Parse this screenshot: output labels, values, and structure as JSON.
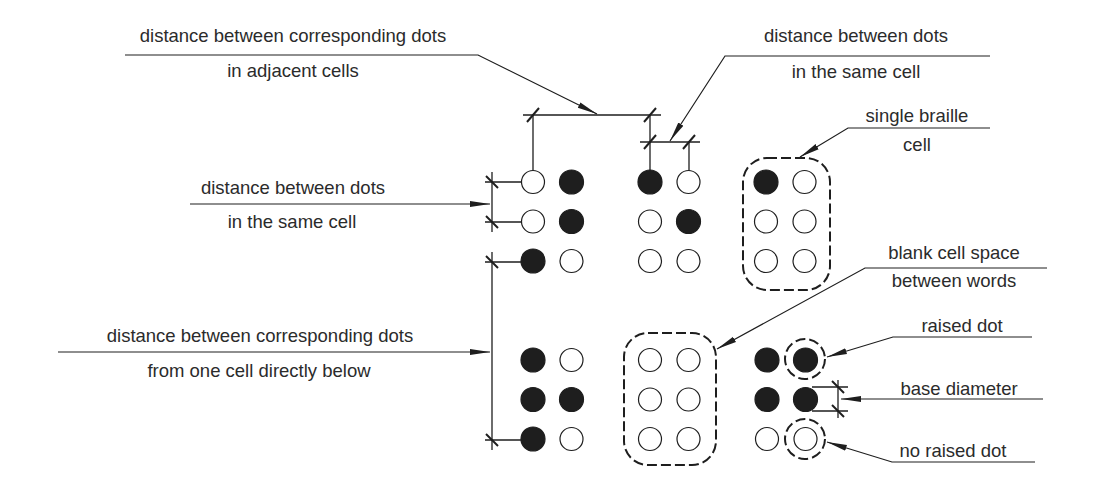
{
  "colors": {
    "ink": "#1e1e1e",
    "text": "#2b2b2b",
    "background": "#ffffff"
  },
  "labels": {
    "adjacent_cells": {
      "line1": "distance between corresponding dots",
      "line2": "in adjacent cells"
    },
    "same_cell_top": {
      "line1": "distance between dots",
      "line2": "in the same cell"
    },
    "same_cell_left": {
      "line1": "distance between dots",
      "line2": "in the same cell"
    },
    "single_cell": {
      "line1": "single braille",
      "line2": "cell"
    },
    "below_cell": {
      "line1": "distance between corresponding dots",
      "line2": "from one cell directly below"
    },
    "blank_cell": {
      "line1": "blank cell space",
      "line2": "between words"
    },
    "raised_dot": {
      "line1": "raised dot"
    },
    "base_diameter": {
      "line1": "base diameter"
    },
    "no_raised_dot": {
      "line1": "no raised dot"
    }
  },
  "cells": [
    {
      "name": "top-cell-1",
      "dots": [
        0,
        1,
        0,
        1,
        1,
        0
      ]
    },
    {
      "name": "top-cell-2",
      "dots": [
        1,
        0,
        0,
        1,
        0,
        0
      ]
    },
    {
      "name": "single-braille-cell",
      "dots": [
        1,
        0,
        0,
        0,
        0,
        0
      ]
    },
    {
      "name": "bottom-cell-1",
      "dots": [
        1,
        0,
        1,
        1,
        1,
        0
      ]
    },
    {
      "name": "blank-cell",
      "dots": [
        0,
        0,
        0,
        0,
        0,
        0
      ]
    },
    {
      "name": "bottom-cell-3",
      "dots": [
        1,
        1,
        1,
        1,
        0,
        0
      ]
    }
  ]
}
